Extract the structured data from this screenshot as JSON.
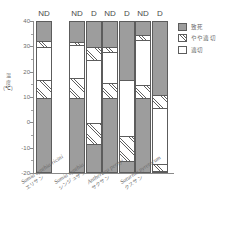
{
  "chart_data": {
    "type": "bar",
    "subtype": "stacked-bar-temperature-range",
    "title": "",
    "xlabel": "",
    "ylabel": "温度 (℃)",
    "ylim": [
      -20,
      40
    ],
    "ytick_values": [
      -20,
      -10,
      0,
      10,
      20,
      30,
      40
    ],
    "ytick_labels": [
      "-20",
      "-10",
      "0",
      "10",
      "20",
      "30",
      "40"
    ],
    "grid": false,
    "legend_position": "right",
    "categories_note": "Each species has ND (non-diapause) and optionally D (diapause) bars",
    "legend": [
      {
        "key": "lethal",
        "label": "致死",
        "color": "#9d9d9d",
        "pattern": "solid-gray"
      },
      {
        "key": "partial",
        "label": "やや適切",
        "color": "#ffffff",
        "pattern": "diagonal-hatch"
      },
      {
        "key": "suitable",
        "label": "適切",
        "color": "#ffffff",
        "pattern": "none"
      }
    ],
    "groups": [
      {
        "species_sci": "Samia cynthia ricini",
        "species_jp": "エリサン",
        "bars": [
          {
            "condition": "ND",
            "segments": [
              {
                "key": "lethal",
                "from": -20,
                "to": 10
              },
              {
                "key": "partial",
                "from": 10,
                "to": 17
              },
              {
                "key": "suitable",
                "from": 17,
                "to": 30
              },
              {
                "key": "partial",
                "from": 30,
                "to": 32.5
              },
              {
                "key": "lethal",
                "from": 32.5,
                "to": 40
              }
            ]
          }
        ]
      },
      {
        "species_sci": "Samia cynthia",
        "species_jp": "シンジュサン",
        "bars": [
          {
            "condition": "ND",
            "segments": [
              {
                "key": "lethal",
                "from": -20,
                "to": 10
              },
              {
                "key": "partial",
                "from": 10,
                "to": 18
              },
              {
                "key": "suitable",
                "from": 18,
                "to": 31
              },
              {
                "key": "partial",
                "from": 31,
                "to": 32
              },
              {
                "key": "lethal",
                "from": 32,
                "to": 40
              }
            ]
          },
          {
            "condition": "D",
            "segments": [
              {
                "key": "lethal",
                "from": -20,
                "to": -8
              },
              {
                "key": "partial",
                "from": -8,
                "to": 0
              },
              {
                "key": "suitable",
                "from": 0,
                "to": 25
              },
              {
                "key": "partial",
                "from": 25,
                "to": 30
              },
              {
                "key": "lethal",
                "from": 30,
                "to": 40
              }
            ]
          }
        ]
      },
      {
        "species_sci": "Antheraea pernyi",
        "species_jp": "サクサン",
        "bars": [
          {
            "condition": "ND",
            "segments": [
              {
                "key": "lethal",
                "from": -20,
                "to": 10
              },
              {
                "key": "partial",
                "from": 10,
                "to": 16
              },
              {
                "key": "suitable",
                "from": 16,
                "to": 28
              },
              {
                "key": "partial",
                "from": 28,
                "to": 30
              },
              {
                "key": "lethal",
                "from": 30,
                "to": 40
              }
            ]
          },
          {
            "condition": "D",
            "segments": [
              {
                "key": "lethal",
                "from": -20,
                "to": -15
              },
              {
                "key": "partial",
                "from": -15,
                "to": -5
              },
              {
                "key": "suitable",
                "from": -5,
                "to": 17
              },
              {
                "key": "lethal",
                "from": 17,
                "to": 40
              }
            ]
          }
        ]
      },
      {
        "species_sci": "Saturnia pyretorum",
        "species_jp": "クスサン",
        "bars": [
          {
            "condition": "ND",
            "segments": [
              {
                "key": "lethal",
                "from": -20,
                "to": 10
              },
              {
                "key": "partial",
                "from": 10,
                "to": 15
              },
              {
                "key": "suitable",
                "from": 15,
                "to": 33
              },
              {
                "key": "partial",
                "from": 33,
                "to": 35
              },
              {
                "key": "lethal",
                "from": 35,
                "to": 40
              }
            ]
          },
          {
            "condition": "D",
            "segments": [
              {
                "key": "lethal",
                "from": -20,
                "to": -19
              },
              {
                "key": "partial",
                "from": -19,
                "to": -16
              },
              {
                "key": "suitable",
                "from": -16,
                "to": 6
              },
              {
                "key": "partial",
                "from": 6,
                "to": 11
              },
              {
                "key": "lethal",
                "from": 11,
                "to": 40
              }
            ]
          }
        ]
      }
    ]
  }
}
